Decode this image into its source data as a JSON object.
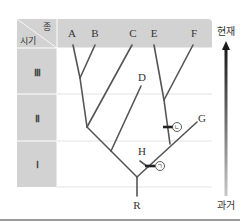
{
  "header": {
    "corner_top": "종",
    "corner_bottom": "시기"
  },
  "periods": [
    {
      "label": "Ⅲ"
    },
    {
      "label": "Ⅱ"
    },
    {
      "label": "Ⅰ"
    }
  ],
  "species": [
    {
      "label": "A"
    },
    {
      "label": "B"
    },
    {
      "label": "C"
    },
    {
      "label": "E"
    },
    {
      "label": "F"
    }
  ],
  "extinct_species": [
    {
      "label": "D"
    },
    {
      "label": "G"
    },
    {
      "label": "H"
    }
  ],
  "root": {
    "label": "R"
  },
  "markers": [
    {
      "label": "ㄱ"
    },
    {
      "label": "ㄴ"
    }
  ],
  "time_axis": {
    "top": "현재",
    "bottom": "과거"
  },
  "colors": {
    "header_fill": "#d2d2d2",
    "branch": "#555555",
    "grid": "#dcdcdc",
    "marker": "#222222"
  }
}
